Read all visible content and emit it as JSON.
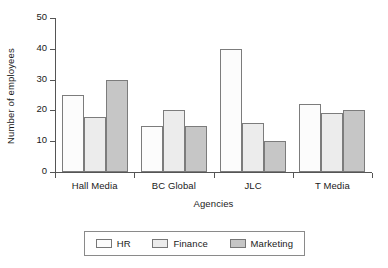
{
  "chart_data": {
    "type": "bar",
    "title": "",
    "xlabel": "Agencies",
    "ylabel": "Number of employees",
    "ylim": [
      0,
      50
    ],
    "yticks": [
      0,
      10,
      20,
      30,
      40,
      50
    ],
    "grid": false,
    "legend_position": "bottom",
    "categories": [
      "Hall Media",
      "BC Global",
      "JLC",
      "T Media"
    ],
    "series": [
      {
        "name": "HR",
        "color": "#fcfcfc",
        "values": [
          25,
          15,
          40,
          22
        ]
      },
      {
        "name": "Finance",
        "color": "#ececec",
        "values": [
          18,
          20,
          16,
          19
        ]
      },
      {
        "name": "Marketing",
        "color": "#c6c6c6",
        "values": [
          30,
          15,
          10,
          20
        ]
      }
    ]
  }
}
